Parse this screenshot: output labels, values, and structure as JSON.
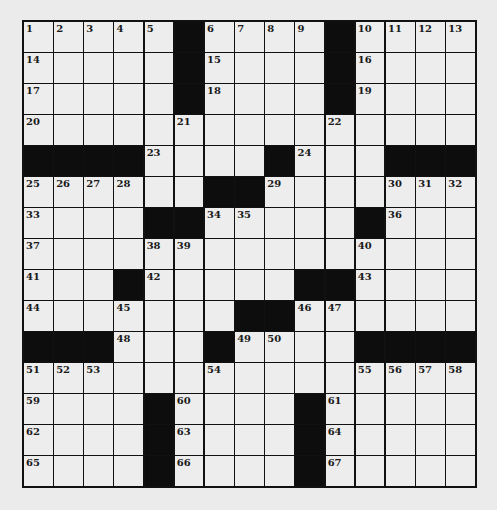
{
  "puzzle": {
    "rows": 15,
    "cols": 15,
    "colors": {
      "block": "#0d0d0d",
      "cell": "#ededed",
      "grid_line": "#111111",
      "background": "#ebebeb"
    },
    "layout": [
      "....#....#....",
      "x"
    ],
    "grid": [
      [
        "1",
        "2",
        "3",
        "4",
        "5",
        "#",
        "6",
        "7",
        "8",
        "9",
        "#",
        "10",
        "11",
        "12",
        "13"
      ],
      [
        "14",
        "",
        "",
        "",
        "",
        "#",
        "15",
        "",
        "",
        "",
        "#",
        "16",
        "",
        "",
        ""
      ],
      [
        "17",
        "",
        "",
        "",
        "",
        "#",
        "18",
        "",
        "",
        "",
        "#",
        "19",
        "",
        "",
        ""
      ],
      [
        "20",
        "",
        "",
        "",
        "",
        "21",
        "",
        "",
        "",
        "",
        "22",
        "",
        "",
        "",
        ""
      ],
      [
        "#",
        "#",
        "#",
        "#",
        "23",
        "",
        "",
        "",
        "#",
        "24",
        "",
        "",
        "#",
        "#",
        "#"
      ],
      [
        "25",
        "26",
        "27",
        "28",
        "",
        "",
        "#",
        "#",
        "29",
        "",
        "",
        "",
        "30",
        "31",
        "32"
      ],
      [
        "33",
        "",
        "",
        "",
        "#",
        "#",
        "34",
        "35",
        "",
        "",
        "",
        "#",
        "36",
        "",
        ""
      ],
      [
        "37",
        "",
        "",
        "",
        "38",
        "39",
        "",
        "",
        "",
        "",
        "",
        "40",
        "",
        "",
        ""
      ],
      [
        "41",
        "",
        "",
        "#",
        "42",
        "",
        "",
        "",
        "",
        "#",
        "#",
        "43",
        "",
        "",
        ""
      ],
      [
        "44",
        "",
        "",
        "45",
        "",
        "",
        "",
        "#",
        "#",
        "46",
        "47",
        "",
        "",
        "",
        ""
      ],
      [
        "#",
        "#",
        "#",
        "48",
        "",
        "",
        "#",
        "49",
        "50",
        "",
        "",
        "#",
        "#",
        "#",
        "#"
      ],
      [
        "51",
        "52",
        "53",
        "",
        "",
        "",
        "54",
        "",
        "",
        "",
        "",
        "55",
        "56",
        "57",
        "58"
      ],
      [
        "59",
        "",
        "",
        "",
        "#",
        "60",
        "",
        "",
        "",
        "#",
        "61",
        "",
        "",
        "",
        ""
      ],
      [
        "62",
        "",
        "",
        "",
        "#",
        "63",
        "",
        "",
        "",
        "#",
        "64",
        "",
        "",
        "",
        ""
      ],
      [
        "65",
        "",
        "",
        "",
        "#",
        "66",
        "",
        "",
        "",
        "#",
        "67",
        "",
        "",
        "",
        ""
      ]
    ]
  }
}
